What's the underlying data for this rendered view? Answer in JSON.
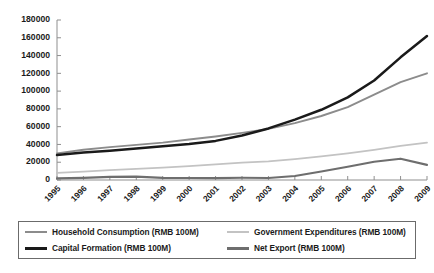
{
  "chart_data": {
    "type": "line",
    "title": "",
    "xlabel": "",
    "ylabel": "",
    "x": [
      1995,
      1996,
      1997,
      1998,
      1999,
      2000,
      2001,
      2002,
      2003,
      2004,
      2005,
      2006,
      2007,
      2008,
      2009
    ],
    "categories": [
      "1995",
      "1996",
      "1997",
      "1998",
      "1999",
      "2000",
      "2001",
      "2002",
      "2003",
      "2004",
      "2005",
      "2006",
      "2007",
      "2008",
      "2009"
    ],
    "ylim": [
      0,
      180000
    ],
    "yticks": [
      0,
      20000,
      40000,
      60000,
      80000,
      100000,
      120000,
      140000,
      160000,
      180000
    ],
    "ytick_labels": [
      "0",
      "20000",
      "40000",
      "60000",
      "80000",
      "100000",
      "120000",
      "140000",
      "160000",
      "180000"
    ],
    "grid": false,
    "legend_position": "bottom",
    "series": [
      {
        "name": "Household Consumption (RMB 100M)",
        "color": "#8c8c8c",
        "width": 1.9,
        "values": [
          30000,
          34000,
          37000,
          39500,
          42000,
          45500,
          49000,
          53000,
          57500,
          64000,
          72000,
          82000,
          96000,
          110000,
          120000
        ]
      },
      {
        "name": "Capital Formation (RMB 100M)",
        "color": "#1a1a1a",
        "width": 2.5,
        "values": [
          28000,
          31000,
          33000,
          35500,
          38000,
          40500,
          44000,
          50000,
          58000,
          68000,
          79000,
          93000,
          112000,
          138000,
          162000
        ]
      },
      {
        "name": "Government Expenditures (RMB 100M)",
        "color": "#c3c3c3",
        "width": 1.8,
        "values": [
          8000,
          9500,
          11000,
          12500,
          14000,
          15500,
          17500,
          19500,
          21000,
          23500,
          26500,
          30000,
          34000,
          38500,
          42000
        ]
      },
      {
        "name": "Net Export (RMB 100M)",
        "color": "#6e6e6e",
        "width": 2.1,
        "values": [
          1800,
          2400,
          3500,
          3800,
          2400,
          2200,
          2100,
          2500,
          2300,
          4500,
          9500,
          15000,
          20500,
          24000,
          17000
        ]
      }
    ]
  },
  "legend": {
    "entries": [
      {
        "label": "Household Consumption (RMB 100M)",
        "color": "#8c8c8c",
        "width": 2
      },
      {
        "label": "Government Expenditures (RMB 100M)",
        "color": "#c3c3c3",
        "width": 2
      },
      {
        "label": "Capital Formation (RMB 100M)",
        "color": "#1a1a1a",
        "width": 3
      },
      {
        "label": "Net Export (RMB 100M)",
        "color": "#6e6e6e",
        "width": 3
      }
    ]
  },
  "axis": {
    "axis_color": "#8f8f8f"
  }
}
